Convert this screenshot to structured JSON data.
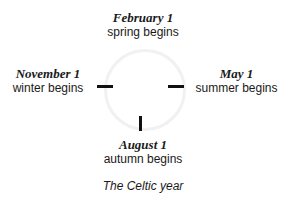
{
  "diagram": {
    "markers": [
      {
        "position": "top",
        "date": "February 1",
        "label": "spring begins"
      },
      {
        "position": "right",
        "date": "May 1",
        "label": "summer begins"
      },
      {
        "position": "bottom",
        "date": "August 1",
        "label": "autumn begins"
      },
      {
        "position": "left",
        "date": "November 1",
        "label": "winter begins"
      }
    ],
    "caption": "The Celtic year"
  }
}
